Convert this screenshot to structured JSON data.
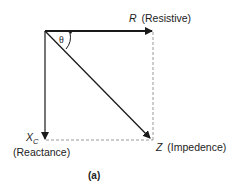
{
  "diagram": {
    "type": "impedance-phasor-diagram",
    "colors": {
      "line": "#1a1a1a",
      "dashed": "#999999",
      "text": "#222222"
    },
    "labels": {
      "resistive_symbol": "R",
      "resistive_text": "(Resistive)",
      "reactance_symbol": "X",
      "reactance_subscript": "C",
      "reactance_text": "(Reactance)",
      "impedance_symbol": "Z",
      "impedance_text": "(Impedence)",
      "angle": "θ",
      "caption": "(a)"
    }
  }
}
